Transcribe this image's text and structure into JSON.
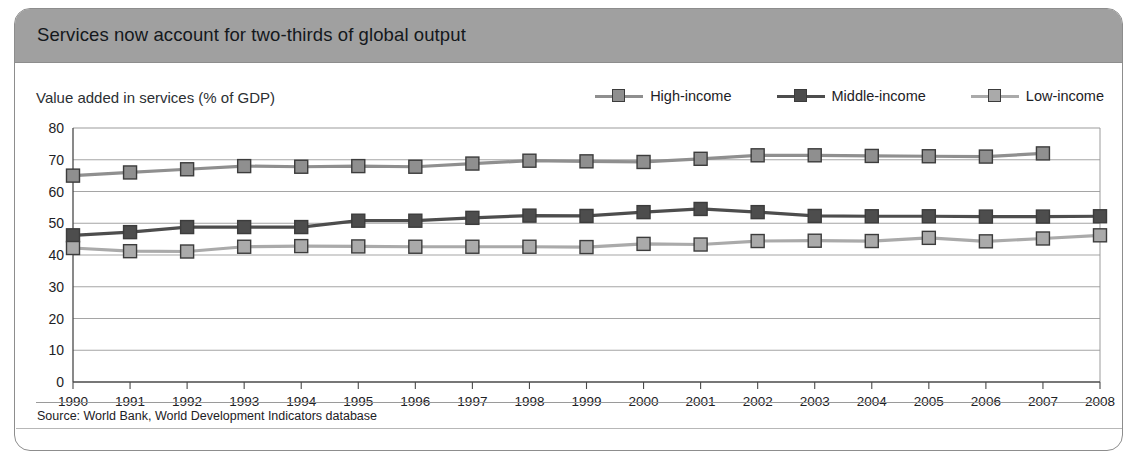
{
  "header": {
    "title": "Services now account for two-thirds of global output"
  },
  "subtitle": "Value added in services (% of GDP)",
  "source": "Source: World Bank, World Development Indicators database",
  "colors": {
    "header_band": "#a0a0a0",
    "frame_border": "#8d8d8d",
    "high_income": "#8f8f8f",
    "middle_income": "#4d4d4d",
    "low_income": "#aaaaaa",
    "marker_edge": "#3c3c3c",
    "gridline": "#9b9b9b",
    "axis": "#4a4a4a",
    "text": "#1d2125"
  },
  "legend": {
    "items": [
      {
        "label": "High-income",
        "color": "#8f8f8f"
      },
      {
        "label": "Middle-income",
        "color": "#4d4d4d"
      },
      {
        "label": "Low-income",
        "color": "#aaaaaa"
      }
    ]
  },
  "chart_data": {
    "type": "line",
    "title": "Services now account for two-thirds of global output",
    "subtitle": "Value added in services (% of GDP)",
    "xlabel": "",
    "ylabel": "Value added in services (% of GDP)",
    "ylim": [
      0,
      80
    ],
    "ytick_step": 10,
    "yticks": [
      0,
      10,
      20,
      30,
      40,
      50,
      60,
      70,
      80
    ],
    "grid": true,
    "legend_position": "top-right",
    "x": [
      1990,
      1991,
      1992,
      1993,
      1994,
      1995,
      1996,
      1997,
      1998,
      1999,
      2000,
      2001,
      2002,
      2003,
      2004,
      2005,
      2006,
      2007,
      2008
    ],
    "categories": [
      "1990",
      "1991",
      "1992",
      "1993",
      "1994",
      "1995",
      "1996",
      "1997",
      "1998",
      "1999",
      "2000",
      "2001",
      "2002",
      "2003",
      "2004",
      "2005",
      "2006",
      "2007",
      "2008"
    ],
    "series": [
      {
        "name": "High-income",
        "color": "#8f8f8f",
        "values": [
          65,
          66,
          67,
          68,
          67.8,
          68,
          67.8,
          68.8,
          69.7,
          69.5,
          69.3,
          70.3,
          71.4,
          71.4,
          71.2,
          71.1,
          71,
          72,
          null
        ]
      },
      {
        "name": "Middle-income",
        "color": "#4d4d4d",
        "values": [
          46.2,
          47.2,
          48.8,
          48.8,
          48.8,
          50.8,
          50.8,
          51.7,
          52.4,
          52.3,
          53.5,
          54.5,
          53.5,
          52.3,
          52.2,
          52.2,
          52.1,
          52.1,
          52.2
        ]
      },
      {
        "name": "Low-income",
        "color": "#aaaaaa",
        "values": [
          42.2,
          41.2,
          41.1,
          42.6,
          42.8,
          42.7,
          42.6,
          42.6,
          42.6,
          42.5,
          43.5,
          43.3,
          44.4,
          44.5,
          44.4,
          45.4,
          44.3,
          45.2,
          46.2
        ]
      }
    ]
  }
}
